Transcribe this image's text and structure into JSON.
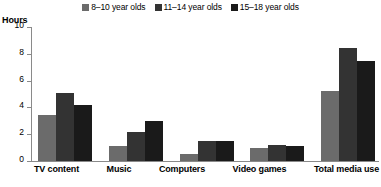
{
  "axis_title": "Hours",
  "legend": {
    "entries": [
      {
        "label": "8–10 year olds",
        "color": "#6b6b6b",
        "swatch_name": "legend-swatch-8-10"
      },
      {
        "label": "11–14 year olds",
        "color": "#333333",
        "swatch_name": "legend-swatch-11-14"
      },
      {
        "label": "15–18 year olds",
        "color": "#1a1a1a",
        "swatch_name": "legend-swatch-15-18"
      }
    ]
  },
  "yaxis": {
    "ticks": [
      "0",
      "2",
      "4",
      "6",
      "8",
      "10"
    ]
  },
  "chart_data": {
    "type": "bar",
    "title": "",
    "subtitle": "",
    "xlabel": "",
    "ylabel": "Hours",
    "ylim": [
      0,
      10
    ],
    "ytick_values": [
      0,
      2,
      4,
      6,
      8,
      10
    ],
    "grid": false,
    "legend_position": "top-center",
    "grouping": "grouped",
    "categories": [
      "TV content",
      "Music",
      "Computers",
      "Video games",
      "Total media use"
    ],
    "series": [
      {
        "name": "8–10 year olds",
        "color": "#6b6b6b",
        "values": [
          3.4,
          1.1,
          0.5,
          1.0,
          5.2
        ]
      },
      {
        "name": "11–14 year olds",
        "color": "#333333",
        "values": [
          5.1,
          2.2,
          1.5,
          1.2,
          8.4
        ]
      },
      {
        "name": "15–18 year olds",
        "color": "#1a1a1a",
        "values": [
          4.2,
          3.0,
          1.5,
          1.1,
          7.5
        ]
      }
    ]
  }
}
